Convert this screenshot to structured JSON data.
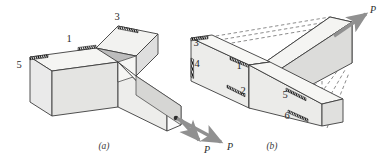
{
  "figure": {
    "background_color": "#ffffff",
    "outline_color": "#3c3c3c",
    "hatch_color": "#1a1a1a",
    "arrow_color": "#8c8c8c",
    "dash_color": "#5a5a5a",
    "faces": {
      "top_light": "#f2f2f0",
      "front_mid": "#e2e2e0",
      "side_dark": "#bdbdbd",
      "end_white": "#fbfbfb",
      "inner_shade": "#c9c9c7"
    }
  },
  "panels": [
    {
      "id": "a",
      "caption": "(a)",
      "caption_x": 104,
      "caption_y": 149,
      "section_labels": [
        {
          "text": "1",
          "x": 69,
          "y": 42
        },
        {
          "text": "3",
          "x": 117,
          "y": 20
        },
        {
          "text": "5",
          "x": 19,
          "y": 68
        }
      ],
      "force_labels": [
        {
          "text": "P",
          "x": 230,
          "y": 150
        }
      ]
    },
    {
      "id": "b",
      "caption": "(b)",
      "caption_x": 272,
      "caption_y": 149,
      "section_labels": [
        {
          "text": "3",
          "x": 196,
          "y": 46
        },
        {
          "text": "4",
          "x": 197,
          "y": 67
        },
        {
          "text": "1",
          "x": 239,
          "y": 69
        },
        {
          "text": "2",
          "x": 243,
          "y": 94
        },
        {
          "text": "5",
          "x": 285,
          "y": 98
        },
        {
          "text": "6",
          "x": 287,
          "y": 119
        }
      ],
      "force_labels": [
        {
          "text": "P",
          "x": 373,
          "y": 13
        },
        {
          "text": "P",
          "x": 207,
          "y": 153
        }
      ]
    }
  ]
}
